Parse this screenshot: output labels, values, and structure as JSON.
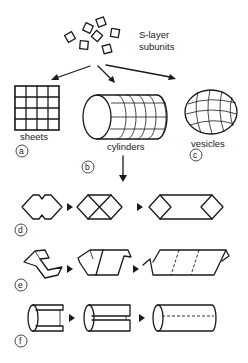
{
  "diagram": {
    "title_label_line1": "S-layer",
    "title_label_line2": "subunits",
    "forms": [
      {
        "id": "a",
        "label": "sheets"
      },
      {
        "id": "b",
        "label": "cylinders"
      },
      {
        "id": "c",
        "label": "vesicles"
      }
    ],
    "panels": [
      {
        "id": "d",
        "description": "hexagonal sheet closing into cylinder"
      },
      {
        "id": "e",
        "description": "helical rolling of strip into cylinder"
      },
      {
        "id": "f",
        "description": "split tube closing into cylinder with seam"
      }
    ],
    "colors": {
      "ink": "#1a1a1a",
      "background": "#ffffff"
    }
  }
}
